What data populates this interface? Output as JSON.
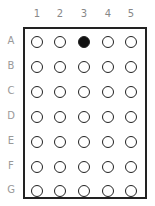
{
  "columns": [
    "1",
    "2",
    "3",
    "4",
    "5"
  ],
  "rows": [
    "A",
    "B",
    "C",
    "D",
    "E",
    "F",
    "G"
  ],
  "filled": [
    [
      "A",
      "3"
    ]
  ],
  "colors": {
    "border": "#222222",
    "filled": "#111111",
    "label": "#888888"
  }
}
